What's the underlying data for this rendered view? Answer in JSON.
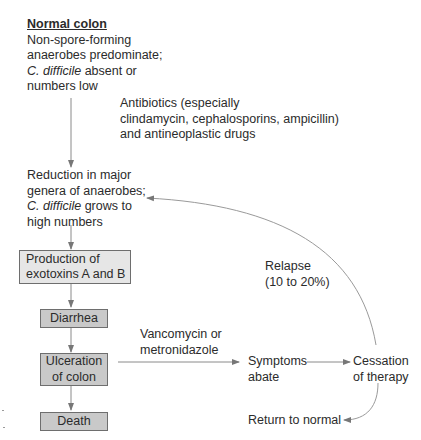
{
  "diagram": {
    "normal_colon": {
      "title": "Normal colon",
      "line1": "Non-spore-forming",
      "line2": "anaerobes predominate;",
      "line3_italic": "C. difficile",
      "line3_rest": " absent or",
      "line4": "numbers low"
    },
    "antibiotics_label": {
      "line1": "Antibiotics (especially",
      "line2": "clindamycin, cephalosporins, ampicillin)",
      "line3": "and antineoplastic drugs"
    },
    "reduction": {
      "line1": "Reduction in major",
      "line2": "genera of anaerobes;",
      "line3_italic": "C. difficile",
      "line3_rest": " grows to",
      "line4": "high numbers"
    },
    "boxes": {
      "production": {
        "line1": "Production of",
        "line2": "exotoxins A and B"
      },
      "diarrhea": {
        "label": "Diarrhea"
      },
      "ulceration": {
        "line1": "Ulceration",
        "line2": "of colon"
      },
      "death": {
        "label": "Death"
      }
    },
    "treatment_label": {
      "line1": "Vancomycin or",
      "line2": "metronidazole"
    },
    "symptoms": {
      "line1": "Symptoms",
      "line2": "abate"
    },
    "cessation": {
      "line1": "Cessation",
      "line2": "of therapy"
    },
    "relapse_label": {
      "line1": "Relapse",
      "line2": "(10 to 20%)"
    },
    "return_normal": {
      "label": "Return to normal"
    },
    "colors": {
      "line": "#8a8a8a",
      "box_light": "#e6e6e6",
      "box_mid": "#c9c9c9",
      "box_border": "#6e6e6e",
      "text": "#2b2b2b"
    }
  }
}
